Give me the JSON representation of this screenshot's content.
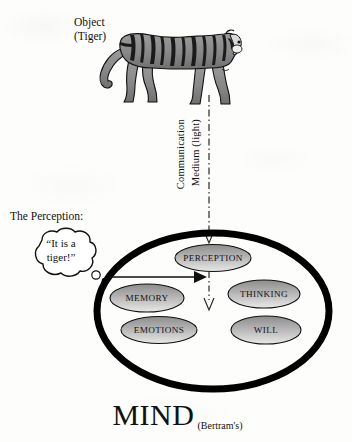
{
  "diagram": {
    "title": "MIND",
    "attribution": "(Bertram's)",
    "object_label_line1": "Object",
    "object_label_line2": "(Tiger)",
    "channel_label_line1": "Communication",
    "channel_label_line2": "Medium (light)",
    "perception_label": "The Perception:",
    "bubble_line1": "“It is a",
    "bubble_line2": "tiger!”",
    "nodes": [
      {
        "id": "perception",
        "label": "PERCEPTION"
      },
      {
        "id": "memory",
        "label": "MEMORY"
      },
      {
        "id": "emotions",
        "label": "EMOTIONS"
      },
      {
        "id": "thinking",
        "label": "THINKING"
      },
      {
        "id": "will",
        "label": "WILL"
      }
    ],
    "colors": {
      "ink": "#111111",
      "background": "#fdfdfc",
      "oval_stroke": "#000000",
      "node_fill_dark": "#8d8d8d",
      "node_fill_light": "#e8e8e8",
      "tiger_body": "#8f8f8f",
      "tiger_stripe": "#1a1a1a"
    }
  }
}
